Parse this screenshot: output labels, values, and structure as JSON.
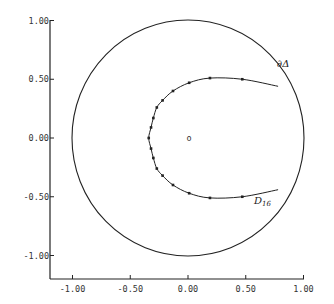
{
  "chart_data": {
    "type": "line",
    "title": "",
    "xlabel": "",
    "ylabel": "",
    "xlim": [
      -1.2,
      1.0
    ],
    "ylim": [
      -1.2,
      1.0
    ],
    "grid": false,
    "x_ticks": [
      "-1.00",
      "-0.50",
      "0.00",
      "0.50",
      "1.00"
    ],
    "y_ticks": [
      "1.00",
      "0.50",
      "0.00",
      "-0.50",
      "-1.00"
    ],
    "series": [
      {
        "name": "∂Δ",
        "kind": "unit-circle",
        "center": [
          0,
          0
        ],
        "radius": 1.0
      },
      {
        "name": "D16",
        "kind": "curve-with-markers",
        "points": [
          [
            0.78,
            0.44
          ],
          [
            0.47,
            0.5
          ],
          [
            0.19,
            0.51
          ],
          [
            0.01,
            0.47
          ],
          [
            -0.13,
            0.4
          ],
          [
            -0.22,
            0.32
          ],
          [
            -0.27,
            0.26
          ],
          [
            -0.3,
            0.17
          ],
          [
            -0.32,
            0.09
          ],
          [
            -0.34,
            0.0
          ],
          [
            -0.32,
            -0.09
          ],
          [
            -0.3,
            -0.17
          ],
          [
            -0.27,
            -0.26
          ],
          [
            -0.22,
            -0.32
          ],
          [
            -0.13,
            -0.4
          ],
          [
            0.01,
            -0.47
          ],
          [
            0.19,
            -0.51
          ],
          [
            0.47,
            -0.5
          ],
          [
            0.78,
            -0.44
          ]
        ],
        "markers": [
          [
            0.47,
            0.5
          ],
          [
            0.19,
            0.51
          ],
          [
            0.01,
            0.47
          ],
          [
            -0.13,
            0.4
          ],
          [
            -0.22,
            0.32
          ],
          [
            -0.27,
            0.26
          ],
          [
            -0.3,
            0.17
          ],
          [
            -0.32,
            0.09
          ],
          [
            -0.34,
            0.0
          ],
          [
            -0.32,
            -0.09
          ],
          [
            -0.3,
            -0.17
          ],
          [
            -0.27,
            -0.26
          ],
          [
            -0.22,
            -0.32
          ],
          [
            -0.13,
            -0.4
          ],
          [
            0.01,
            -0.47
          ],
          [
            0.19,
            -0.51
          ],
          [
            0.47,
            -0.5
          ]
        ]
      },
      {
        "name": "origin",
        "kind": "point",
        "points": [
          [
            0,
            0
          ]
        ],
        "label": "o"
      }
    ],
    "annotations": [
      {
        "text": "∂Δ",
        "at": [
          0.8,
          0.64
        ]
      },
      {
        "text": "D",
        "subscript": "16",
        "at": [
          0.58,
          -0.52
        ]
      }
    ]
  },
  "labels": {
    "boundary": "∂Δ",
    "curve_main": "D",
    "curve_sub": "16",
    "origin": "o"
  }
}
